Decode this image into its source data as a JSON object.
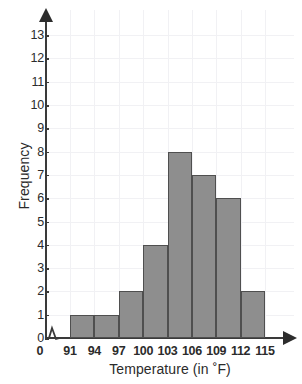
{
  "chart_data": {
    "type": "bar",
    "title": "",
    "xlabel": "Temperature (in ˚F)",
    "ylabel": "Frequency",
    "categories": [
      "91-94",
      "94-97",
      "97-100",
      "100-103",
      "103-106",
      "106-109",
      "109-112",
      "112-115"
    ],
    "bin_edges": [
      91,
      94,
      97,
      100,
      103,
      106,
      109,
      112,
      115
    ],
    "values": [
      1,
      1,
      2,
      4,
      8,
      7,
      6,
      2
    ],
    "x_tick_labels": [
      "91",
      "94",
      "97",
      "100",
      "103",
      "106",
      "109",
      "112",
      "115"
    ],
    "y_tick_labels": [
      "0",
      "1",
      "2",
      "3",
      "4",
      "5",
      "6",
      "7",
      "8",
      "9",
      "10",
      "11",
      "12",
      "13"
    ],
    "ylim": [
      0,
      13
    ],
    "y_tick_step": 1,
    "xlim": [
      91,
      115
    ],
    "x_tick_step": 3,
    "origin_label": "0",
    "axis_break": true,
    "grid": true,
    "legend": false,
    "bar_fill_color": "#8e8e8e",
    "bar_border_color": "#4f4f4f",
    "axis_color": "#3a3a3a",
    "gridline_color": "#f1f1f4",
    "background_color": "#ffffff"
  }
}
